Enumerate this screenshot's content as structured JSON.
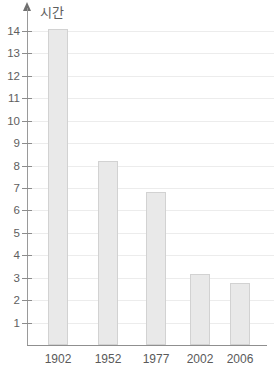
{
  "chart_data": {
    "type": "bar",
    "title": "",
    "xlabel": "",
    "ylabel": "시간",
    "categories": [
      "1902",
      "1952",
      "1977",
      "2002",
      "2006"
    ],
    "values": [
      14.1,
      8.2,
      6.8,
      3.15,
      2.75
    ],
    "ylim": [
      0,
      14.6
    ],
    "yticks": [
      1,
      2,
      3,
      4,
      5,
      6,
      7,
      8,
      9,
      10,
      11,
      12,
      13,
      14
    ],
    "ytick_labels": [
      "1",
      "2",
      "3",
      "4",
      "5",
      "6",
      "7",
      "8",
      "9",
      "10",
      "11",
      "12",
      "13",
      "14"
    ],
    "grid": true,
    "legend": null,
    "bar_color": "#e9e9e9",
    "bar_border_color": "#d2d2d2",
    "grid_color": "#ececec",
    "axis_color": "#8f8f8f",
    "text_color": "#5a5a5a"
  }
}
